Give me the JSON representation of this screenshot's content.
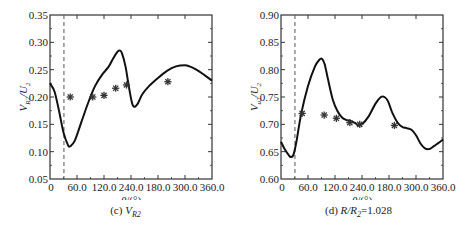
{
  "chart_data": [
    {
      "type": "line",
      "panel": "c",
      "caption": "(c) V_R2",
      "caption_prefix": "(c) ",
      "caption_var": "V",
      "caption_sub": "R2",
      "xlabel": "θ/(°)",
      "ylabel": "V_R2/U_2",
      "xlim": [
        0,
        360
      ],
      "ylim": [
        0.05,
        0.35
      ],
      "x_tick_labels": [
        "0",
        "60.0",
        "120.0",
        "240.0",
        "180.0",
        "300.0",
        "360.0"
      ],
      "y_tick_labels": [
        "0.05",
        "0.10",
        "0.15",
        "0.20",
        "0.25",
        "0.30",
        "0.35"
      ],
      "grid": false,
      "dashed_vline_x": 31,
      "series": [
        {
          "name": "simulation",
          "style": "solid-line",
          "x": [
            0,
            10,
            20,
            30,
            40,
            45,
            55,
            70,
            85,
            100,
            115,
            130,
            140,
            150,
            155,
            160,
            168,
            175,
            182,
            187,
            195,
            205,
            220,
            240,
            260,
            280,
            300,
            310,
            325,
            340,
            360
          ],
          "y": [
            0.225,
            0.21,
            0.175,
            0.135,
            0.112,
            0.11,
            0.12,
            0.155,
            0.19,
            0.22,
            0.24,
            0.255,
            0.27,
            0.283,
            0.285,
            0.28,
            0.255,
            0.22,
            0.19,
            0.182,
            0.188,
            0.205,
            0.22,
            0.235,
            0.248,
            0.256,
            0.258,
            0.256,
            0.25,
            0.242,
            0.23
          ]
        },
        {
          "name": "experiment",
          "style": "asterisk-marker",
          "x": [
            45,
            95,
            120,
            146,
            170,
            262
          ],
          "y": [
            0.2,
            0.2,
            0.203,
            0.216,
            0.222,
            0.228
          ]
        }
      ]
    },
    {
      "type": "line",
      "panel": "d",
      "caption": "(d) R/R2=1.028",
      "caption_prefix": "(d) ",
      "caption_var": "R/R",
      "caption_sub": "2",
      "caption_suffix": "=1.028",
      "xlabel": "θ/(°)",
      "ylabel": "V_u2/U_2",
      "xlim": [
        0,
        360
      ],
      "ylim": [
        0.6,
        0.9
      ],
      "x_tick_labels": [
        "0",
        "60.0",
        "120.0",
        "240.0",
        "180.0",
        "300.0",
        "360.0"
      ],
      "y_tick_labels": [
        "0.60",
        "0.65",
        "0.70",
        "0.75",
        "0.80",
        "0.85",
        "0.90"
      ],
      "grid": false,
      "dashed_vline_x": 31,
      "series": [
        {
          "name": "simulation",
          "style": "solid-line",
          "x": [
            0,
            8,
            16,
            22,
            28,
            35,
            45,
            60,
            75,
            85,
            91,
            97,
            105,
            115,
            125,
            135,
            145,
            155,
            165,
            172,
            180,
            195,
            210,
            222,
            230,
            238,
            248,
            260,
            270,
            280,
            290,
            300,
            310,
            320,
            330,
            340,
            350,
            360
          ],
          "y": [
            0.668,
            0.655,
            0.645,
            0.64,
            0.645,
            0.672,
            0.72,
            0.77,
            0.805,
            0.818,
            0.82,
            0.81,
            0.78,
            0.745,
            0.725,
            0.713,
            0.708,
            0.706,
            0.702,
            0.698,
            0.7,
            0.715,
            0.738,
            0.75,
            0.75,
            0.742,
            0.72,
            0.702,
            0.695,
            0.693,
            0.69,
            0.68,
            0.665,
            0.656,
            0.655,
            0.66,
            0.666,
            0.672
          ]
        },
        {
          "name": "experiment",
          "style": "asterisk-marker",
          "x": [
            47,
            96,
            123,
            153,
            175,
            252
          ],
          "y": [
            0.72,
            0.717,
            0.711,
            0.703,
            0.7,
            0.698
          ]
        }
      ]
    }
  ],
  "colors": {
    "line": "#111111",
    "axis": "#333333",
    "marker": "#333333",
    "dashed": "#555555"
  }
}
